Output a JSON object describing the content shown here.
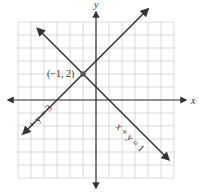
{
  "chart_data": {
    "type": "line",
    "title": "",
    "xlabel": "x",
    "ylabel": "y",
    "xlim": [
      -6,
      6
    ],
    "ylim": [
      -6,
      6
    ],
    "grid": true,
    "series": [
      {
        "name": "-x + y = 3",
        "equation": "y = x + 3",
        "slope": 1,
        "intercept": 3,
        "x": [
          -5.6,
          4.0
        ],
        "y": [
          -2.6,
          7.0
        ]
      },
      {
        "name": "x + y = 1",
        "equation": "y = -x + 1",
        "slope": -1,
        "intercept": 1,
        "x": [
          -4.5,
          5.6
        ],
        "y": [
          5.5,
          -4.6
        ]
      }
    ],
    "points": [
      {
        "label": "(−1, 2)",
        "x": -1,
        "y": 2
      }
    ],
    "annotations": [
      {
        "text": "−x + y = 3",
        "series": 0
      },
      {
        "text": "x + y = 1",
        "series": 1
      }
    ]
  },
  "colors": {
    "line": "#333333",
    "grid": "#d0d0d0",
    "point": "#555555"
  }
}
